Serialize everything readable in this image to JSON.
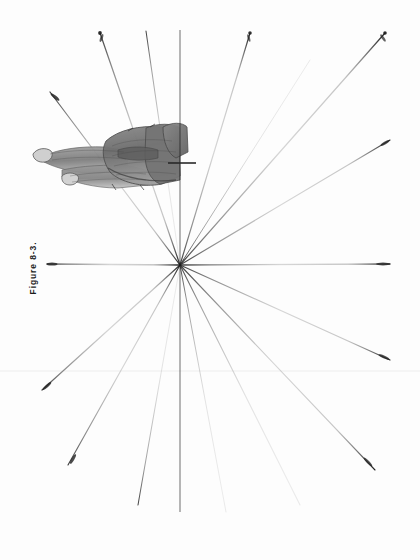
{
  "page": {
    "width": 420,
    "height": 560,
    "background_color": "#fdfdfd",
    "medium": "graphite pencil drawing on paper, scanned book page"
  },
  "caption": {
    "text": "Figure 8-3.",
    "rotation_degrees": -90,
    "position": {
      "x": 33,
      "y": 268
    },
    "color": "#1c1c1c"
  },
  "drawing": {
    "title": "Reclining figure with one-point perspective construction lines",
    "ink_color": "#2a2a2a",
    "vanishing_point": {
      "x": 180,
      "y": 265
    },
    "vertical_axis": {
      "name": "central-vertical-line",
      "x": 180,
      "y_start": 30,
      "y_end": 512,
      "stroke_width": 3.0,
      "color": "#2b2b2b"
    },
    "scan_artifact": {
      "name": "horizontal-scan-line",
      "y": 371,
      "color": "#eeeeee"
    },
    "rays": [
      {
        "id": "ray-01",
        "angle_deg": 254,
        "x2": 100,
        "y2": 33,
        "tip": true
      },
      {
        "id": "ray-02",
        "angle_deg": 262,
        "x2": 146,
        "y2": 31,
        "tip": false
      },
      {
        "id": "ray-03",
        "angle_deg": 278,
        "x2": 250,
        "y2": 33,
        "tip": true
      },
      {
        "id": "ray-04",
        "angle_deg": 292,
        "x2": 310,
        "y2": 60,
        "tip": false
      },
      {
        "id": "ray-05",
        "angle_deg": 305,
        "x2": 385,
        "y2": 33,
        "tip": true
      },
      {
        "id": "ray-06",
        "angle_deg": 330,
        "x2": 390,
        "y2": 140,
        "tip": true
      },
      {
        "id": "ray-07",
        "angle_deg": 0,
        "x2": 390,
        "y2": 264,
        "tip": true
      },
      {
        "id": "ray-08",
        "angle_deg": 28,
        "x2": 390,
        "y2": 360,
        "tip": true
      },
      {
        "id": "ray-09",
        "angle_deg": 48,
        "x2": 375,
        "y2": 470,
        "tip": true
      },
      {
        "id": "ray-10",
        "angle_deg": 68,
        "x2": 300,
        "y2": 505,
        "tip": false
      },
      {
        "id": "ray-11",
        "angle_deg": 82,
        "x2": 226,
        "y2": 512,
        "tip": false
      },
      {
        "id": "ray-12",
        "angle_deg": 100,
        "x2": 138,
        "y2": 505,
        "tip": false
      },
      {
        "id": "ray-13",
        "angle_deg": 118,
        "x2": 68,
        "y2": 465,
        "tip": true
      },
      {
        "id": "ray-14",
        "angle_deg": 140,
        "x2": 42,
        "y2": 390,
        "tip": true
      },
      {
        "id": "ray-15",
        "angle_deg": 180,
        "x2": 47,
        "y2": 264,
        "tip": true
      },
      {
        "id": "ray-16",
        "angle_deg": 214,
        "x2": 50,
        "y2": 92,
        "tip": true
      }
    ],
    "subject": {
      "name": "reclining-figure",
      "description": "shaded graphite study of a reclining human figure, rotated 90 degrees",
      "bounds": {
        "x": 30,
        "y": 118,
        "width": 160,
        "height": 72
      }
    }
  }
}
